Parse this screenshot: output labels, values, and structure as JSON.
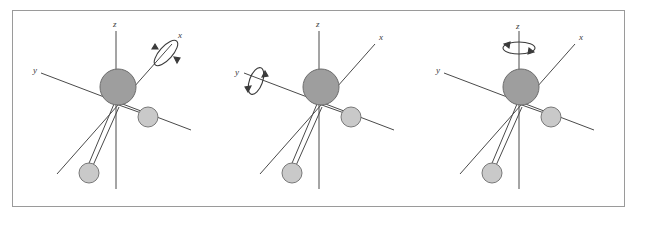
{
  "figure": {
    "caption": "",
    "panels": [
      {
        "id": "panel-x",
        "rotation_axis": "x",
        "axis_labels": {
          "x": "x",
          "y": "y",
          "z": "z"
        }
      },
      {
        "id": "panel-y",
        "rotation_axis": "y",
        "axis_labels": {
          "x": "x",
          "y": "y",
          "z": "z"
        }
      },
      {
        "id": "panel-z",
        "rotation_axis": "z",
        "axis_labels": {
          "x": "x",
          "y": "y",
          "z": "z"
        }
      }
    ],
    "colors": {
      "frame_border": "#9a9a9a",
      "axis_stroke": "#4a4a4a",
      "bond_stroke": "#4a4a4a",
      "atom_large_fill": "#9e9e9e",
      "atom_large_stroke": "#6d6d6d",
      "atom_small_fill": "#c9c9c9",
      "atom_small_stroke": "#787878",
      "label_color": "#3a3a3a",
      "background": "#ffffff"
    },
    "molecule": {
      "central_atom": {
        "label": "",
        "radius": 18
      },
      "substituent_atoms": [
        {
          "label": "",
          "radius": 10
        },
        {
          "label": "",
          "radius": 10
        }
      ],
      "bond_count": 2
    }
  }
}
